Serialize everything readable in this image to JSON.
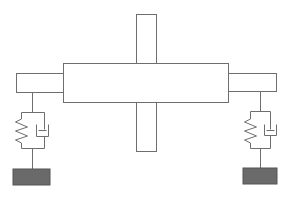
{
  "diagram": {
    "type": "mechanical-schematic",
    "colors": {
      "stroke": "#6e6e6e",
      "fill": "#ffffff",
      "ground": "#6a6a6a",
      "background": "#ffffff"
    },
    "components": {
      "vertical_bar": {
        "x": 136,
        "y": 14,
        "w": 20,
        "h": 137
      },
      "main_body": {
        "x": 63,
        "y": 63,
        "w": 165,
        "h": 39
      },
      "left_arm": {
        "x": 16,
        "y": 73,
        "w": 47,
        "h": 19
      },
      "right_arm": {
        "x": 228,
        "y": 73,
        "w": 48,
        "h": 18
      },
      "left_mount": {
        "stem_x": 32,
        "top_y": 92,
        "frame": {
          "x1": 21,
          "x2": 44,
          "y1": 112,
          "y2": 148
        },
        "ground": {
          "x": 13,
          "y": 169,
          "w": 37,
          "h": 16
        }
      },
      "right_mount": {
        "stem_x": 260,
        "top_y": 91,
        "frame": {
          "x1": 250,
          "x2": 270,
          "y1": 111,
          "y2": 148
        },
        "ground": {
          "x": 243,
          "y": 168,
          "w": 34,
          "h": 16
        }
      }
    },
    "labels": []
  }
}
